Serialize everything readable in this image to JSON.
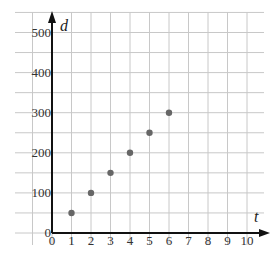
{
  "chart_data": {
    "type": "scatter",
    "title": "",
    "xlabel": "t",
    "ylabel": "d",
    "x_ticks": [
      "0",
      "1",
      "2",
      "3",
      "4",
      "5",
      "6",
      "7",
      "8",
      "9",
      "10"
    ],
    "y_ticks": [
      "0",
      "100",
      "200",
      "300",
      "400",
      "500"
    ],
    "xlim": [
      0,
      10
    ],
    "ylim": [
      0,
      500
    ],
    "grid": true,
    "points": [
      {
        "x": 1,
        "y": 50
      },
      {
        "x": 2,
        "y": 100
      },
      {
        "x": 3,
        "y": 150
      },
      {
        "x": 4,
        "y": 200
      },
      {
        "x": 5,
        "y": 250
      },
      {
        "x": 6,
        "y": 300
      }
    ],
    "colors": {
      "point": "#666666",
      "grid": "#c8c8c8",
      "axis": "#111111"
    }
  }
}
